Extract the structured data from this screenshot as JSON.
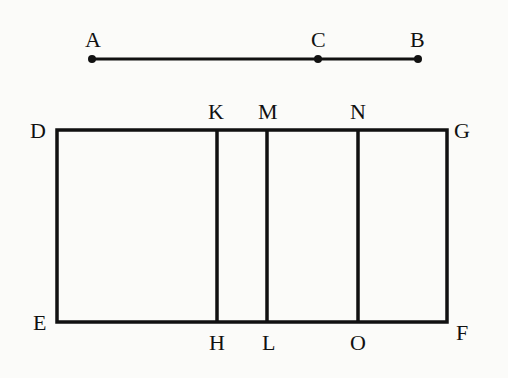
{
  "diagram": {
    "type": "geometric-figure",
    "segment": {
      "points": [
        {
          "label": "A",
          "x": 92,
          "y": 59
        },
        {
          "label": "C",
          "x": 318,
          "y": 59
        },
        {
          "label": "B",
          "x": 418,
          "y": 59
        }
      ]
    },
    "rectangle": {
      "corners": {
        "D": {
          "x": 57,
          "y": 130
        },
        "G": {
          "x": 447,
          "y": 130
        },
        "F": {
          "x": 447,
          "y": 322
        },
        "E": {
          "x": 57,
          "y": 322
        }
      },
      "dividers": [
        {
          "top": "K",
          "bottom": "H",
          "x": 217
        },
        {
          "top": "M",
          "bottom": "L",
          "x": 267
        },
        {
          "top": "N",
          "bottom": "O",
          "x": 358
        }
      ]
    },
    "labels": {
      "A": "A",
      "B": "B",
      "C": "C",
      "D": "D",
      "E": "E",
      "F": "F",
      "G": "G",
      "H": "H",
      "K": "K",
      "L": "L",
      "M": "M",
      "N": "N",
      "O": "O"
    },
    "colors": {
      "line": "#111111",
      "background": "#fbfbf9"
    }
  }
}
